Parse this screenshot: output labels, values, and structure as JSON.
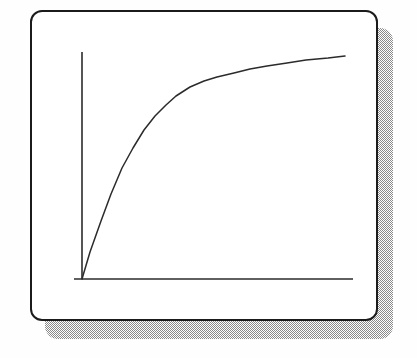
{
  "figure": {
    "caption": "",
    "background_color": "#fefefe"
  },
  "card": {
    "name": "rounded-card-panel",
    "fill_color": "#ffffff",
    "border_color": "#1b1b1b",
    "border_width_px": 2,
    "corner_radius_px": 12,
    "x": 30,
    "y": 10,
    "width": 348,
    "height": 311
  },
  "shadow": {
    "name": "dithered-drop-shadow",
    "color": "#8a8a8a",
    "pattern": "checkerboard-dither-50",
    "offset_x": 15,
    "offset_y": 18,
    "corner_radius_px": 13
  },
  "chart_data": {
    "type": "line",
    "title": "",
    "subtitle": "",
    "xlabel": "",
    "ylabel": "",
    "grid": false,
    "legend": null,
    "legend_position": "none",
    "annotations": [],
    "xticklabels": [],
    "yticklabels": [],
    "xlim": [
      0,
      100
    ],
    "ylim": [
      0,
      100
    ],
    "axes": {
      "y_axis_line": {
        "x": 82,
        "y_top": 52,
        "y_bottom": 279
      },
      "x_axis_line": {
        "y": 279,
        "x_left": 74,
        "x_right": 353
      },
      "axis_color": "#2b2b2b",
      "axis_width_px": 1.6
    },
    "series": [
      {
        "name": "saturation-curve",
        "color": "#2b2b2b",
        "line_width_px": 1.5,
        "description": "Monotonically increasing curve rising steeply from the origin then flattening to a horizontal asymptote.",
        "x": [
          0,
          3,
          7,
          11,
          15,
          19,
          23,
          27,
          31,
          35,
          40,
          45,
          50,
          56,
          62,
          68,
          75,
          82,
          90,
          100
        ],
        "y": [
          0,
          12,
          26,
          38,
          49,
          58,
          66,
          72,
          77,
          81,
          85,
          88,
          90.5,
          92.5,
          94,
          95.5,
          96.5,
          97.5,
          98.5,
          100
        ],
        "pixel_points": [
          [
            82,
            279
          ],
          [
            90,
            252
          ],
          [
            101,
            221
          ],
          [
            111,
            194
          ],
          [
            122,
            168
          ],
          [
            133,
            148
          ],
          [
            144,
            130
          ],
          [
            155,
            116
          ],
          [
            166,
            105
          ],
          [
            176,
            96
          ],
          [
            190,
            87
          ],
          [
            204,
            81
          ],
          [
            217,
            77
          ],
          [
            234,
            73
          ],
          [
            250,
            69
          ],
          [
            267,
            66
          ],
          [
            287,
            63
          ],
          [
            306,
            60
          ],
          [
            328,
            58
          ],
          [
            345,
            56
          ]
        ]
      }
    ]
  }
}
